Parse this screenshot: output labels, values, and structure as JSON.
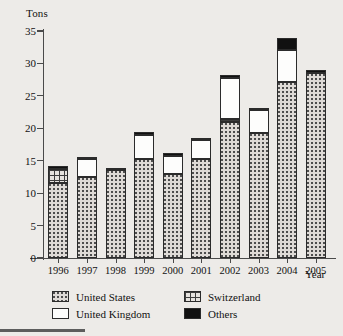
{
  "chart_data": {
    "type": "bar",
    "subtype": "stacked-bar",
    "title": "",
    "xlabel": "Year",
    "ylabel": "Tons",
    "ylim": [
      0,
      35
    ],
    "yticks": [
      0,
      5,
      10,
      15,
      20,
      25,
      30,
      35
    ],
    "ytick_labels": [
      "0",
      "5",
      "10",
      "15",
      "20",
      "25",
      "30",
      "35"
    ],
    "grid": false,
    "legend_position": "bottom",
    "categories": [
      "1996",
      "1997",
      "1998",
      "1999",
      "2000",
      "2001",
      "2002",
      "2003",
      "2004",
      "2005"
    ],
    "series": [
      {
        "name": "United States",
        "pattern": "dotted",
        "color": "#dedad6",
        "values": [
          11.5,
          12.5,
          13.5,
          15.2,
          13.0,
          15.3,
          21.0,
          19.2,
          27.1,
          28.6
        ]
      },
      {
        "name": "Switzerland",
        "pattern": "grid",
        "color": "#e6e3df",
        "values": [
          2.3,
          0,
          0,
          0,
          0,
          0,
          0.5,
          0,
          0,
          0
        ]
      },
      {
        "name": "United Kingdom",
        "pattern": "solid-white",
        "color": "#fdfdfc",
        "values": [
          0,
          2.7,
          0,
          3.8,
          2.7,
          2.9,
          6.2,
          3.6,
          5.0,
          0
        ]
      },
      {
        "name": "Others",
        "pattern": "solid-black",
        "color": "#111111",
        "values": [
          0.4,
          0.3,
          0.4,
          0.4,
          0.5,
          0.3,
          0.5,
          0.2,
          1.9,
          0.4
        ]
      }
    ],
    "totals": [
      14.2,
      15.5,
      13.9,
      19.4,
      16.2,
      18.5,
      27.7,
      23.0,
      34.0,
      29.0
    ]
  },
  "axes": {
    "y_title": "Tons",
    "x_title": "Year"
  },
  "legend": {
    "items": [
      {
        "label": "United States",
        "swatch": "us-dotted-swatch"
      },
      {
        "label": "Switzerland",
        "swatch": "switzerland-grid-swatch"
      },
      {
        "label": "United Kingdom",
        "swatch": "uk-white-swatch"
      },
      {
        "label": "Others",
        "swatch": "others-black-swatch"
      }
    ]
  }
}
